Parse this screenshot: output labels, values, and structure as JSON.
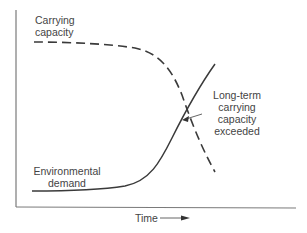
{
  "diagram": {
    "type": "conceptual line diagram",
    "x_axis_label": "Time",
    "y_axis_label": "",
    "curves": [
      {
        "id": "carrying-capacity",
        "label_line1": "Carrying",
        "label_line2": "capacity",
        "style": "dashed",
        "trend": "flat then declining"
      },
      {
        "id": "environmental-demand",
        "label_line1": "Environmental",
        "label_line2": "demand",
        "style": "solid",
        "trend": "flat then rising"
      }
    ],
    "annotation": {
      "line1": "Long-term",
      "line2": "carrying",
      "line3": "capacity",
      "line4": "exceeded",
      "points_to": "intersection of curves"
    },
    "colors": {
      "line": "#3a3a3a",
      "axis": "#6a6a6a",
      "text": "#444444",
      "background": "#ffffff"
    }
  }
}
